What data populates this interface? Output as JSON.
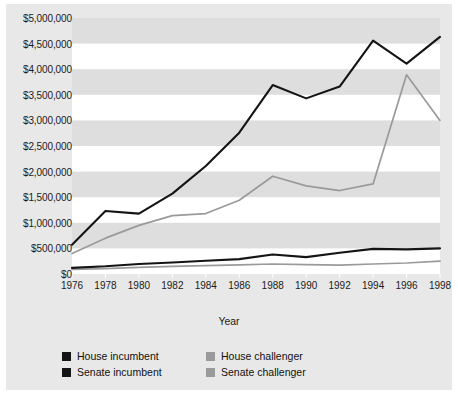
{
  "chart_data": {
    "type": "line",
    "title": "",
    "xlabel": "Year",
    "ylabel": "",
    "grid": "horizontal-bands",
    "legend_position": "bottom",
    "categories": [
      1976,
      1978,
      1980,
      1982,
      1984,
      1986,
      1988,
      1990,
      1992,
      1994,
      1996,
      1998
    ],
    "x": [
      1976,
      1978,
      1980,
      1982,
      1984,
      1986,
      1988,
      1990,
      1992,
      1994,
      1996,
      1998
    ],
    "xlim": [
      1976,
      1998
    ],
    "ylim": [
      0,
      5000000
    ],
    "ytick_labels": [
      "$5,000,000",
      "$4,500,000",
      "$4,000,000",
      "$3,500,000",
      "$3,000,000",
      "$2,500,000",
      "$2,000,000",
      "$1,500,000",
      "$1,000,000",
      "$500,000",
      "$0"
    ],
    "ytick_values": [
      5000000,
      4500000,
      4000000,
      3500000,
      3000000,
      2500000,
      2000000,
      1500000,
      1000000,
      500000,
      0
    ],
    "xtick_labels": [
      "1976",
      "1978",
      "1980",
      "1982",
      "1984",
      "1986",
      "1988",
      "1990",
      "1992",
      "1994",
      "1996",
      "1998"
    ],
    "series": [
      {
        "name": "House incumbent",
        "color": "#141414",
        "values": [
          570000,
          1230000,
          1180000,
          1570000,
          2110000,
          2760000,
          3690000,
          3430000,
          3660000,
          4560000,
          4110000,
          4630000
        ]
      },
      {
        "name": "Senate incumbent",
        "color": "#141414",
        "values": [
          120000,
          150000,
          195000,
          225000,
          260000,
          290000,
          380000,
          330000,
          415000,
          490000,
          480000,
          500000
        ]
      },
      {
        "name": "House challenger",
        "color": "#9a9a9a",
        "values": [
          400000,
          700000,
          950000,
          1140000,
          1180000,
          1440000,
          1910000,
          1720000,
          1630000,
          1760000,
          3890000,
          3000000
        ]
      },
      {
        "name": "Senate challenger",
        "color": "#9a9a9a",
        "values": [
          90000,
          105000,
          130000,
          150000,
          165000,
          180000,
          195000,
          185000,
          175000,
          195000,
          215000,
          250000
        ]
      }
    ],
    "series_render_order": [
      "House challenger",
      "Senate challenger",
      "House incumbent",
      "Senate incumbent"
    ]
  },
  "legend": {
    "items": [
      {
        "label": "House incumbent",
        "color": "#141414"
      },
      {
        "label": "House challenger",
        "color": "#9a9a9a"
      },
      {
        "label": "Senate incumbent",
        "color": "#141414"
      },
      {
        "label": "Senate challenger",
        "color": "#9a9a9a"
      }
    ]
  },
  "axis": {
    "x_title": "Year"
  },
  "style": {
    "panel_background": "#e8e8e8",
    "plot_background": "#ffffff",
    "band_color": "#dedede",
    "text_color": "#1b1b1b"
  }
}
